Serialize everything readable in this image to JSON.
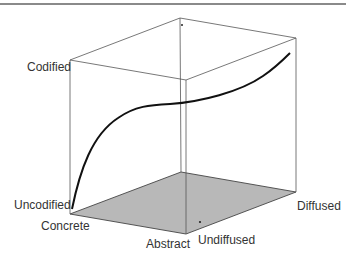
{
  "diagram": {
    "type": "3d-cube",
    "axes": {
      "vertical": {
        "high": "Codified",
        "low": "Uncodified"
      },
      "depth": {
        "near": "Concrete",
        "far": "Abstract"
      },
      "horizontal": {
        "low": "Undiffused",
        "high": "Diffused"
      }
    },
    "colors": {
      "edges": "#555555",
      "floor": "#b8b8b8",
      "curve": "#111111",
      "header_rule": "#8a8a8a"
    }
  },
  "labels": {
    "codified": "Codified",
    "uncodified": "Uncodified",
    "concrete": "Concrete",
    "abstract": "Abstract",
    "undiffused": "Undiffused",
    "diffused": "Diffused"
  }
}
